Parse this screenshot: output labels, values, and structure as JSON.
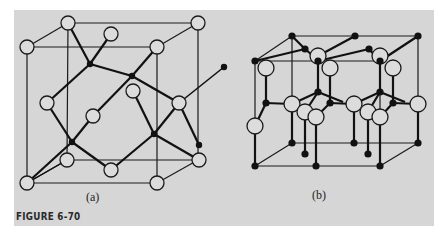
{
  "figure": {
    "label": "FIGURE 6-70",
    "panels": [
      {
        "id": "a",
        "caption": "(a)",
        "structure": "cubic unit cell (zinc blende / diamond-type)"
      },
      {
        "id": "b",
        "caption": "(b)",
        "structure": "hexagonal unit cell (wurtzite-type)"
      }
    ]
  },
  "colors": {
    "background": "#ffffff",
    "panel": "#d6d6d6",
    "line": "#1a1a1a",
    "open_atom_fill": "#dcdcdc",
    "filled_atom": "#111111"
  },
  "legend": {
    "open_circle": "large atom (open circle)",
    "filled_circle": "small atom (filled dot)"
  }
}
